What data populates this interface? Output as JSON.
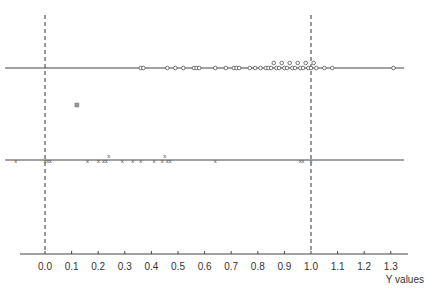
{
  "chart_data": {
    "type": "scatter",
    "title": "",
    "xlabel": "Y values",
    "ylabel": "",
    "xlim": [
      -0.1,
      1.35
    ],
    "x_ticks": [
      "0.0",
      "0.1",
      "0.2",
      "0.3",
      "0.4",
      "0.5",
      "0.6",
      "0.7",
      "0.8",
      "0.9",
      "1.0",
      "1.1",
      "1.2",
      "1.3"
    ],
    "reference_lines": [
      0.0,
      1.0
    ],
    "grid": false,
    "series": [
      {
        "name": "upper row (circles)",
        "marker": "o",
        "line_range": [
          -0.15,
          1.35
        ],
        "values": [
          0.36,
          0.37,
          0.46,
          0.49,
          0.52,
          0.56,
          0.57,
          0.58,
          0.64,
          0.68,
          0.71,
          0.72,
          0.73,
          0.77,
          0.79,
          0.81,
          0.83,
          0.84,
          0.85,
          0.86,
          0.87,
          0.88,
          0.89,
          0.9,
          0.91,
          0.92,
          0.93,
          0.94,
          0.95,
          0.96,
          0.97,
          0.98,
          0.99,
          1.0,
          1.01,
          1.02,
          1.05,
          1.08,
          1.31
        ]
      },
      {
        "name": "lower row (x marks)",
        "marker": "x",
        "line_range": [
          -0.15,
          1.35
        ],
        "values": [
          -0.11,
          0.0,
          0.01,
          0.02,
          0.16,
          0.2,
          0.22,
          0.23,
          0.24,
          0.29,
          0.33,
          0.36,
          0.41,
          0.44,
          0.45,
          0.46,
          0.47,
          0.64,
          0.96,
          0.97,
          1.0
        ]
      },
      {
        "name": "outlier",
        "marker": "square",
        "points": [
          {
            "x": 0.12,
            "row": "middle"
          }
        ]
      }
    ]
  }
}
